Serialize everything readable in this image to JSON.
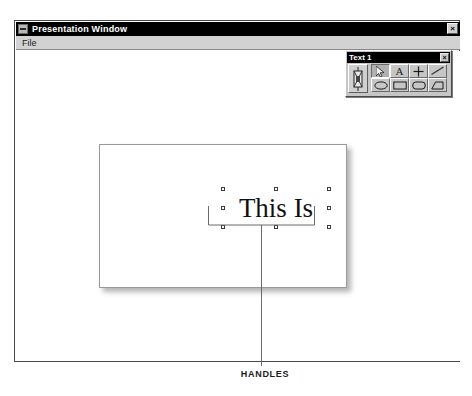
{
  "window": {
    "title": "Presentation Window",
    "menu_icon": "window-menu-icon",
    "close_label": "×",
    "menus": [
      {
        "label": "File"
      }
    ]
  },
  "slide": {
    "text_object": {
      "content": "This Is",
      "handle_count": 8,
      "handles": [
        "top-left",
        "top-center",
        "top-right",
        "middle-left",
        "middle-right",
        "bottom-left",
        "bottom-center",
        "bottom-right"
      ]
    }
  },
  "annotation": {
    "caption": "HANDLES",
    "leader_color": "#6b6b6b"
  },
  "palette": {
    "title": "Text 1",
    "close_label": "×",
    "object_tool": {
      "name": "object-tool",
      "label": ""
    },
    "tools": [
      {
        "name": "pointer-tool",
        "label": "",
        "selected": true
      },
      {
        "name": "text-tool",
        "label": "A",
        "selected": false
      },
      {
        "name": "crosshair-tool",
        "label": "+",
        "selected": false
      },
      {
        "name": "line-tool",
        "label": "",
        "selected": false
      },
      {
        "name": "ellipse-tool",
        "label": "",
        "selected": false
      },
      {
        "name": "rectangle-tool",
        "label": "",
        "selected": false
      },
      {
        "name": "rounded-rectangle-tool",
        "label": "",
        "selected": false
      },
      {
        "name": "polygon-tool",
        "label": "",
        "selected": false
      }
    ]
  },
  "colors": {
    "titlebar": "#000000",
    "titlebar_text": "#ffffff",
    "window_face": "#d2d2d2",
    "palette_face": "#c6c6c6",
    "canvas": "#ffffff",
    "handle_border": "#3a3a3a"
  }
}
